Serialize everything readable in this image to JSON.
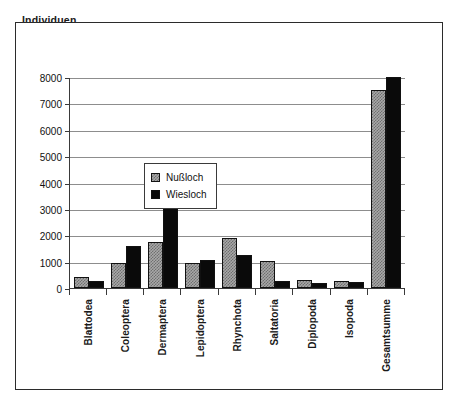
{
  "chart_data": {
    "type": "bar",
    "title": "Individuen",
    "xlabel": "",
    "ylabel": "",
    "ylim": [
      0,
      8000
    ],
    "yticks": [
      0,
      1000,
      2000,
      3000,
      4000,
      5000,
      6000,
      7000,
      8000
    ],
    "ytick_labels": [
      "0",
      "1000",
      "2000",
      "3000",
      "4000",
      "5000",
      "6000",
      "7000",
      "8000"
    ],
    "grid": true,
    "legend_position": "upper-left-inside",
    "categories": [
      "Blattodea",
      "Coleoptera",
      "Dermaptera",
      "Lepidoptera",
      "Rhynchota",
      "Saltatoria",
      "Diplopoda",
      "Isopoda",
      "Gesamtsumme"
    ],
    "series": [
      {
        "name": "Nußloch",
        "color": "#a8a8a8",
        "pattern": "checker",
        "values": [
          430,
          950,
          1750,
          960,
          1910,
          1010,
          300,
          270,
          7500
        ]
      },
      {
        "name": "Wiesloch",
        "color": "#0a0a0a",
        "pattern": "solid",
        "values": [
          250,
          1580,
          3300,
          1050,
          1250,
          270,
          190,
          220,
          8000
        ]
      }
    ]
  }
}
